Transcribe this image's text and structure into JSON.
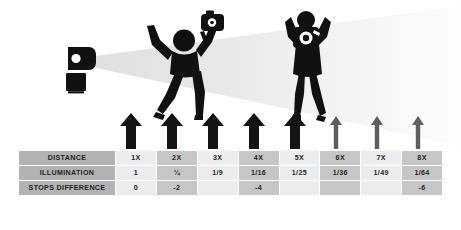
{
  "diagram": {
    "flash": {
      "icon": "flash-strobe-icon",
      "label": ""
    },
    "light_cone": {
      "icon": "light-cone-gradient",
      "near_color": "#e3e3e3",
      "far_color": "#fdfdfd"
    },
    "figures": [
      {
        "icon": "jumping-person-with-camera-icon",
        "position": "near"
      },
      {
        "icon": "person-holding-camera-overhead-icon",
        "position": "far"
      }
    ],
    "arrows": [
      {
        "icon": "up-arrow-icon",
        "color": "#1a1a1a",
        "weight": "bold"
      },
      {
        "icon": "up-arrow-icon",
        "color": "#1a1a1a",
        "weight": "bold"
      },
      {
        "icon": "up-arrow-icon",
        "color": "#1a1a1a",
        "weight": "bold"
      },
      {
        "icon": "up-arrow-icon",
        "color": "#1a1a1a",
        "weight": "bold"
      },
      {
        "icon": "up-arrow-icon",
        "color": "#1a1a1a",
        "weight": "bold"
      },
      {
        "icon": "up-arrow-icon",
        "color": "#5e5e5e",
        "weight": "thin"
      },
      {
        "icon": "up-arrow-icon",
        "color": "#5e5e5e",
        "weight": "thin"
      },
      {
        "icon": "up-arrow-icon",
        "color": "#5e5e5e",
        "weight": "thin"
      }
    ]
  },
  "table": {
    "row_labels": [
      "DISTANCE",
      "ILLUMINATION",
      "STOPS DIFFERENCE"
    ],
    "rows": [
      {
        "label": "DISTANCE",
        "values": [
          "1X",
          "2X",
          "3X",
          "4X",
          "5X",
          "6X",
          "7X",
          "8X"
        ]
      },
      {
        "label": "ILLUMINATION",
        "values": [
          "1",
          "¼",
          "1/9",
          "1/16",
          "1/25",
          "1/36",
          "1/49",
          "1/64"
        ]
      },
      {
        "label": "STOPS DIFFERENCE",
        "values": [
          "0",
          "-2",
          "",
          "-4",
          "",
          "",
          "",
          "-6"
        ]
      }
    ],
    "colors": {
      "label_bg": "#b3b3b3",
      "cell_light_bg": "#ececec",
      "cell_dark_bg": "#c6c6c6",
      "text": "#231f20"
    }
  }
}
